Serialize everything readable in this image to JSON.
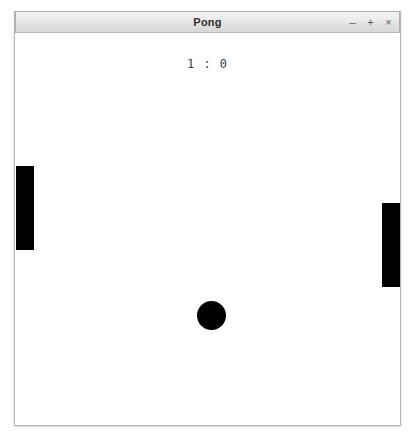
{
  "window": {
    "title": "Pong",
    "controls": [
      {
        "name": "minimize",
        "glyph": "–"
      },
      {
        "name": "maximize",
        "glyph": "+"
      },
      {
        "name": "close",
        "glyph": "×"
      }
    ]
  },
  "game": {
    "score_text": "1 : 0",
    "left_score": 1,
    "right_score": 0,
    "ball_color": "#000000",
    "paddle_color": "#000000",
    "field_color": "#ffffff"
  }
}
